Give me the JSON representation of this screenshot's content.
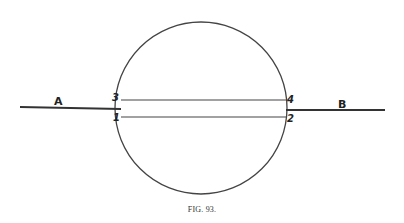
{
  "figure": {
    "caption": "FIG. 93.",
    "labels": {
      "left_line": "A",
      "right_line": "B",
      "point_upper_left": "3",
      "point_lower_left": "1",
      "point_upper_right": "4",
      "point_lower_right": "2"
    },
    "colors": {
      "stroke": "#333333",
      "background": "#ffffff"
    }
  }
}
